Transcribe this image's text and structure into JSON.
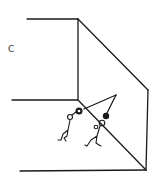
{
  "diagram": {
    "label": "C",
    "colors": {
      "ink": "#1a1a1a",
      "background": "#ffffff"
    }
  }
}
